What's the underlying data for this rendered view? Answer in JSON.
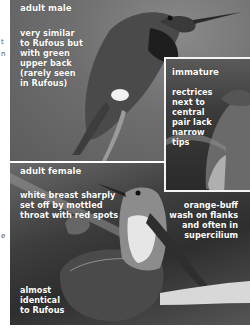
{
  "gutter": {
    "frag1": "t",
    "frag2": "n",
    "frag3": "e"
  },
  "panels": {
    "adult_male": {
      "title": "adult male",
      "note_lines": [
        "very similar",
        "to Rufous but",
        "with green",
        "upper back",
        "(rarely seen",
        "in Rufous)"
      ]
    },
    "immature": {
      "title": "immature",
      "note_lines": [
        "rectrices",
        "next to",
        "central",
        "pair lack",
        "narrow",
        "tips"
      ]
    },
    "adult_female": {
      "title": "adult female",
      "note_left_lines": [
        "white breast sharply",
        "set off by mottled",
        "throat with red spots"
      ],
      "note_right_lines": [
        "orange-buff",
        "wash on flanks",
        "and often in",
        "supercilium"
      ],
      "note_bottom_lines": [
        "almost",
        "identical",
        "to Rufous"
      ]
    }
  },
  "colors": {
    "label_text": "#ffffff",
    "inset_border": "#f4f4f4",
    "page_bg": "#ffffff"
  }
}
